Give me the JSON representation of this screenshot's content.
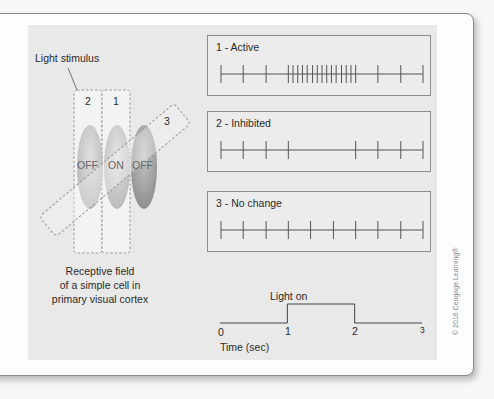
{
  "figure": {
    "stimulus_label": "Light stimulus",
    "bars": [
      {
        "id": "2",
        "label": "2"
      },
      {
        "id": "1",
        "label": "1"
      },
      {
        "id": "3",
        "label": "3"
      }
    ],
    "receptive_field_regions": [
      {
        "label": "OFF",
        "color": "#b9b9b9"
      },
      {
        "label": "ON",
        "color": "#c4c4c4"
      },
      {
        "label": "OFF",
        "color": "#9e9e9e"
      }
    ],
    "caption_lines": [
      "Receptive field",
      "of a simple cell in",
      "primary visual cortex"
    ]
  },
  "responses": [
    {
      "title": "1 - Active",
      "spikes": [
        0,
        0.33,
        0.67,
        1.0,
        1.07,
        1.14,
        1.21,
        1.28,
        1.36,
        1.43,
        1.5,
        1.57,
        1.64,
        1.71,
        1.79,
        1.86,
        1.93,
        2.0,
        2.33,
        2.67,
        3.0
      ]
    },
    {
      "title": "2 - Inhibited",
      "spikes": [
        0,
        0.33,
        0.67,
        1.0,
        2.0,
        2.33,
        2.67,
        3.0
      ]
    },
    {
      "title": "3 - No change",
      "spikes": [
        0,
        0.33,
        0.67,
        1.0,
        1.33,
        1.67,
        2.0,
        2.33,
        2.67,
        3.0
      ]
    }
  ],
  "timeline": {
    "light_label": "Light on",
    "light_on_start": 1,
    "light_on_end": 2,
    "ticks": [
      "0",
      "1",
      "2",
      "3"
    ],
    "axis_label": "Time (sec)"
  },
  "copyright": "© 2016 Cengage Learning®"
}
